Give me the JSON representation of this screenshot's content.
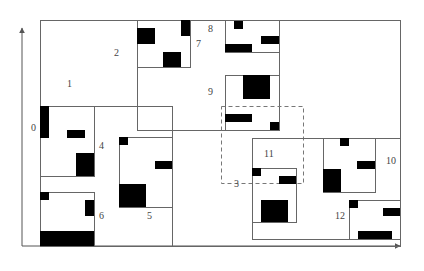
{
  "diagram": {
    "type": "spatial-index-partition",
    "colors": {
      "line": "#666666",
      "object": "#000000",
      "label": "#444444",
      "background": "#ffffff"
    },
    "axes": {
      "x_axis": {
        "from": [
          22,
          246
        ],
        "to": [
          400,
          246
        ]
      },
      "y_axis": {
        "from": [
          22,
          246
        ],
        "to": [
          22,
          28
        ]
      }
    },
    "node_labels": [
      {
        "id": "0",
        "text": "0",
        "x": 31,
        "y": 131
      },
      {
        "id": "1",
        "text": "1",
        "x": 67,
        "y": 87
      },
      {
        "id": "2",
        "text": "2",
        "x": 114,
        "y": 56
      },
      {
        "id": "3",
        "text": "3",
        "x": 234,
        "y": 187
      },
      {
        "id": "4",
        "text": "4",
        "x": 99,
        "y": 149
      },
      {
        "id": "5",
        "text": "5",
        "x": 147,
        "y": 219
      },
      {
        "id": "6",
        "text": "6",
        "x": 99,
        "y": 219
      },
      {
        "id": "7",
        "text": "7",
        "x": 196,
        "y": 47
      },
      {
        "id": "8",
        "text": "8",
        "x": 208,
        "y": 32
      },
      {
        "id": "9",
        "text": "9",
        "x": 208,
        "y": 95
      },
      {
        "id": "10",
        "text": "10",
        "x": 386,
        "y": 164
      },
      {
        "id": "11",
        "text": "11",
        "x": 264,
        "y": 157
      },
      {
        "id": "12",
        "text": "12",
        "x": 335,
        "y": 219
      }
    ],
    "regions": [
      {
        "id": "root-outer",
        "x": 40,
        "y": 20,
        "w": 360,
        "h": 226,
        "style": "solid"
      },
      {
        "id": "node-1",
        "x": 40,
        "y": 20,
        "w": 97,
        "h": 86,
        "style": "solid"
      },
      {
        "id": "node-2",
        "x": 137,
        "y": 20,
        "w": 142,
        "h": 110,
        "style": "solid"
      },
      {
        "id": "node-7",
        "x": 137,
        "y": 20,
        "w": 53,
        "h": 47,
        "style": "solid"
      },
      {
        "id": "node-8",
        "x": 225,
        "y": 20,
        "w": 54,
        "h": 32,
        "style": "solid"
      },
      {
        "id": "node-9",
        "x": 225,
        "y": 75,
        "w": 54,
        "h": 55,
        "style": "solid"
      },
      {
        "id": "node-0",
        "x": 40,
        "y": 106,
        "w": 132,
        "h": 140,
        "style": "solid"
      },
      {
        "id": "node-4",
        "x": 40,
        "y": 106,
        "w": 54,
        "h": 70,
        "style": "solid"
      },
      {
        "id": "node-6",
        "x": 40,
        "y": 192,
        "w": 54,
        "h": 54,
        "style": "solid"
      },
      {
        "id": "node-5",
        "x": 119,
        "y": 137,
        "w": 53,
        "h": 70,
        "style": "solid"
      },
      {
        "id": "node-3-query",
        "x": 221,
        "y": 106,
        "w": 82,
        "h": 77,
        "style": "dashed"
      },
      {
        "id": "node-11-outer",
        "x": 252,
        "y": 138,
        "w": 148,
        "h": 101,
        "style": "solid"
      },
      {
        "id": "node-11",
        "x": 252,
        "y": 168,
        "w": 44,
        "h": 54,
        "style": "solid"
      },
      {
        "id": "node-10",
        "x": 323,
        "y": 138,
        "w": 52,
        "h": 54,
        "style": "solid"
      },
      {
        "id": "node-12",
        "x": 349,
        "y": 200,
        "w": 51,
        "h": 39,
        "style": "solid"
      }
    ],
    "objects": [
      {
        "id": "obj-7a",
        "x": 137,
        "y": 28,
        "w": 18,
        "h": 16
      },
      {
        "id": "obj-7b",
        "x": 163,
        "y": 52,
        "w": 18,
        "h": 15
      },
      {
        "id": "obj-7c",
        "x": 181,
        "y": 20,
        "w": 9,
        "h": 16
      },
      {
        "id": "obj-8a",
        "x": 234,
        "y": 21,
        "w": 9,
        "h": 8
      },
      {
        "id": "obj-8b",
        "x": 261,
        "y": 36,
        "w": 18,
        "h": 8
      },
      {
        "id": "obj-8c",
        "x": 225,
        "y": 44,
        "w": 27,
        "h": 8
      },
      {
        "id": "obj-9a",
        "x": 243,
        "y": 75,
        "w": 27,
        "h": 24
      },
      {
        "id": "obj-9b",
        "x": 225,
        "y": 114,
        "w": 27,
        "h": 8
      },
      {
        "id": "obj-9c",
        "x": 270,
        "y": 122,
        "w": 9,
        "h": 8
      },
      {
        "id": "obj-0a",
        "x": 40,
        "y": 106,
        "w": 9,
        "h": 32
      },
      {
        "id": "obj-4a",
        "x": 67,
        "y": 130,
        "w": 18,
        "h": 8
      },
      {
        "id": "obj-4b",
        "x": 76,
        "y": 153,
        "w": 18,
        "h": 23
      },
      {
        "id": "obj-6a",
        "x": 40,
        "y": 192,
        "w": 9,
        "h": 8
      },
      {
        "id": "obj-6b",
        "x": 85,
        "y": 200,
        "w": 9,
        "h": 16
      },
      {
        "id": "obj-6c",
        "x": 40,
        "y": 231,
        "w": 54,
        "h": 15
      },
      {
        "id": "obj-5a",
        "x": 119,
        "y": 137,
        "w": 9,
        "h": 8
      },
      {
        "id": "obj-5b",
        "x": 155,
        "y": 161,
        "w": 17,
        "h": 8
      },
      {
        "id": "obj-5c",
        "x": 119,
        "y": 184,
        "w": 27,
        "h": 23
      },
      {
        "id": "obj-11a",
        "x": 252,
        "y": 168,
        "w": 9,
        "h": 8
      },
      {
        "id": "obj-11b",
        "x": 279,
        "y": 176,
        "w": 17,
        "h": 8
      },
      {
        "id": "obj-11c",
        "x": 261,
        "y": 200,
        "w": 27,
        "h": 22
      },
      {
        "id": "obj-10a",
        "x": 340,
        "y": 138,
        "w": 9,
        "h": 8
      },
      {
        "id": "obj-10b",
        "x": 357,
        "y": 161,
        "w": 18,
        "h": 8
      },
      {
        "id": "obj-10c",
        "x": 323,
        "y": 169,
        "w": 18,
        "h": 23
      },
      {
        "id": "obj-12a",
        "x": 349,
        "y": 200,
        "w": 9,
        "h": 8
      },
      {
        "id": "obj-12b",
        "x": 383,
        "y": 208,
        "w": 17,
        "h": 8
      },
      {
        "id": "obj-12c",
        "x": 358,
        "y": 231,
        "w": 34,
        "h": 8
      }
    ]
  }
}
